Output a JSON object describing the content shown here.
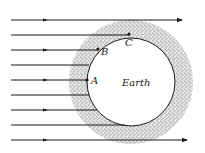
{
  "diagram": {
    "earth": {
      "label": "Earth",
      "cx": 131,
      "cy": 82,
      "r": 44,
      "fill": "#ffffff"
    },
    "atmosphere": {
      "outer_r": 62,
      "color": "#6b6b6b"
    },
    "points": [
      {
        "label": "A",
        "x": 87,
        "y": 80,
        "lx": 91,
        "ly": 84
      },
      {
        "label": "B",
        "x": 98,
        "y": 49,
        "lx": 101,
        "ly": 55
      },
      {
        "label": "C",
        "x": 129,
        "y": 34,
        "lx": 125,
        "ly": 46
      }
    ],
    "rays": [
      {
        "y": 20,
        "x1": 11,
        "x2": 182,
        "arrow_end": true,
        "mid_arrow": true
      },
      {
        "y": 35,
        "x1": 11,
        "x2": 129,
        "arrow_end": false,
        "mid_arrow": false
      },
      {
        "y": 50,
        "x1": 11,
        "x2": 98,
        "arrow_end": false,
        "mid_arrow": true
      },
      {
        "y": 65,
        "x1": 11,
        "x2": 89,
        "arrow_end": false,
        "mid_arrow": false
      },
      {
        "y": 80,
        "x1": 11,
        "x2": 87,
        "arrow_end": false,
        "mid_arrow": true
      },
      {
        "y": 95,
        "x1": 11,
        "x2": 89,
        "arrow_end": false,
        "mid_arrow": false
      },
      {
        "y": 110,
        "x1": 11,
        "x2": 97,
        "arrow_end": false,
        "mid_arrow": true
      },
      {
        "y": 125,
        "x1": 11,
        "x2": 125,
        "arrow_end": false,
        "mid_arrow": false
      },
      {
        "y": 140,
        "x1": 11,
        "x2": 187,
        "arrow_end": true,
        "mid_arrow": true
      }
    ],
    "line_color": "#1a1a1a"
  }
}
